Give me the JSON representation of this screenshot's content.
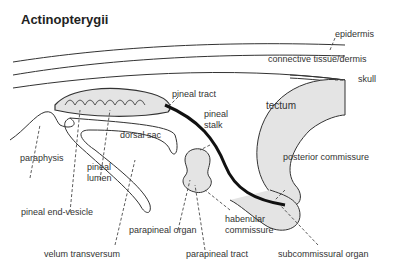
{
  "title": "Actinopterygii",
  "labels": {
    "epidermis": "epidermis",
    "connective": "connective tissue/dermis",
    "skull": "skull",
    "pineal_tract": "pineal tract",
    "pineal_stalk_1": "pineal",
    "pineal_stalk_2": "stalk",
    "tectum": "tectum",
    "dorsal_sac": "dorsal sac",
    "paraphysis": "paraphysis",
    "pineal_lumen_1": "pineal",
    "pineal_lumen_2": "lumen",
    "posterior_commissure": "posterior commissure",
    "pineal_end_vesicle": "pineal end-vesicle",
    "parapineal_organ": "parapineal organ",
    "habenular_1": "habenular",
    "habenular_2": "commissure",
    "velum": "velum transversum",
    "parapineal_tract": "parapineal tract",
    "subcommissural": "subcommissural organ"
  },
  "colors": {
    "line": "#333333",
    "fill": "#e4e4e4",
    "text": "#333333"
  }
}
